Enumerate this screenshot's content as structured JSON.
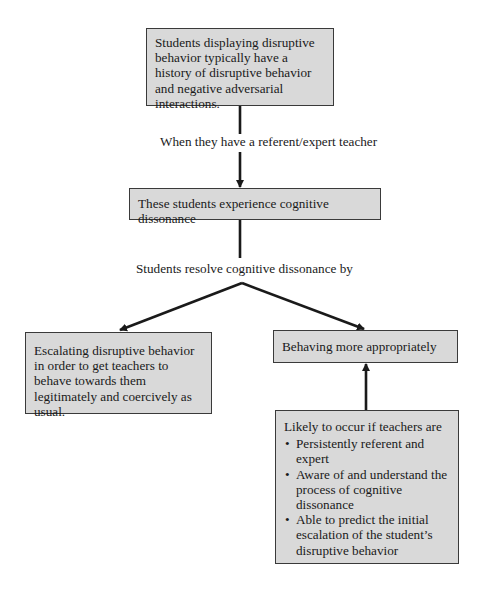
{
  "diagram": {
    "type": "flowchart",
    "nodes": {
      "history": {
        "text": "Students displaying disruptive behavior typically have a history of disruptive behavior and negative adversarial interactions."
      },
      "dissonance": {
        "text": "These students experience cognitive dissonance"
      },
      "escalating": {
        "text": "Escalating disruptive behavior in order to get teachers to behave towards them legitimately and coercively as usual."
      },
      "appropriate": {
        "text": "Behaving more appropriately"
      },
      "conditions": {
        "heading": "Likely to occur if teachers are",
        "bullets": [
          "Persistently referent and expert",
          "Aware of and understand the process of cognitive dissonance",
          "Able to predict the initial escalation of the student’s disruptive behavior"
        ]
      }
    },
    "edge_labels": {
      "when_referent": "When they have a referent/expert teacher",
      "resolve_by": "Students resolve cognitive dissonance by"
    },
    "edges": [
      {
        "from": "history",
        "to": "dissonance",
        "label": "When they have a referent/expert teacher"
      },
      {
        "from": "dissonance",
        "to": "escalating",
        "label": "Students resolve cognitive dissonance by"
      },
      {
        "from": "dissonance",
        "to": "appropriate",
        "label": "Students resolve cognitive dissonance by"
      },
      {
        "from": "conditions",
        "to": "appropriate"
      }
    ],
    "colors": {
      "box_fill": "#d9d9d9",
      "box_border": "#3a3a3a",
      "arrow": "#1a1a1a"
    }
  }
}
